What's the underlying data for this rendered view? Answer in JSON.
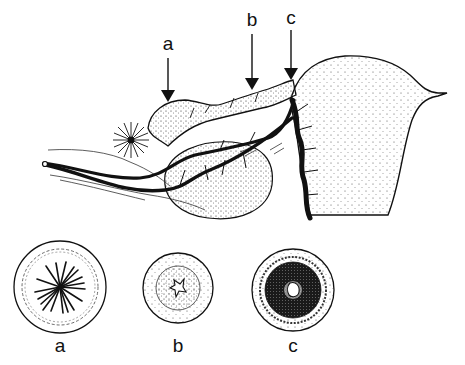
{
  "diagram": {
    "ink_color": "#111111",
    "background": "#ffffff",
    "arrow_labels": [
      {
        "id": "a",
        "text": "a",
        "x": 168,
        "y": 50
      },
      {
        "id": "b",
        "text": "b",
        "x": 252,
        "y": 26
      },
      {
        "id": "c",
        "text": "c",
        "x": 291,
        "y": 24
      }
    ],
    "cross_sections": [
      {
        "id": "a",
        "label": "a",
        "cx": 60,
        "cy": 287,
        "r": 46,
        "description": "highly folded mucosa"
      },
      {
        "id": "b",
        "label": "b",
        "cx": 178,
        "cy": 288,
        "r": 35,
        "description": "narrow lumen, moderate wall"
      },
      {
        "id": "c",
        "label": "c",
        "cx": 293,
        "cy": 290,
        "r": 41,
        "description": "small lumen, thick dark wall"
      }
    ]
  }
}
